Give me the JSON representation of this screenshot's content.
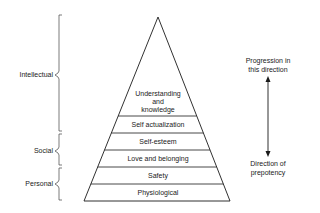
{
  "pyramid": {
    "levels": [
      {
        "label": "Understanding and knowledge",
        "line1": "Understanding",
        "line2": "and",
        "line3": "knowledge"
      },
      {
        "label": "Self actualization"
      },
      {
        "label": "Self-esteem"
      },
      {
        "label": "Love and belonging"
      },
      {
        "label": "Safety"
      },
      {
        "label": "Physiological"
      }
    ]
  },
  "groups": [
    {
      "label": "Intellectual"
    },
    {
      "label": "Social"
    },
    {
      "label": "Personal"
    }
  ],
  "arrow": {
    "top_line1": "Progression in",
    "top_line2": "this direction",
    "bottom_line1": "Direction of",
    "bottom_line2": "prepotency"
  },
  "colors": {
    "line": "#1a1a1a",
    "background": "#ffffff"
  }
}
